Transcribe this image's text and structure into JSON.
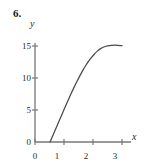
{
  "figure": {
    "problem_number": "6."
  },
  "chart_data": {
    "type": "line",
    "title": "",
    "xlabel": "x",
    "ylabel": "y",
    "xlim": [
      0,
      3.3
    ],
    "ylim": [
      0,
      16.5
    ],
    "xticks": [
      0,
      1,
      2,
      3
    ],
    "xtick_labels": [
      "0",
      "1",
      "2",
      "3"
    ],
    "yticks": [
      0,
      5,
      10,
      15
    ],
    "ytick_labels": [
      "0",
      "5",
      "10",
      "15"
    ],
    "grid": false,
    "legend": null,
    "annotations": [],
    "series": [
      {
        "name": "curve",
        "color": "#4a4a4a",
        "x": [
          0.52,
          0.6,
          0.7,
          0.8,
          0.9,
          1.0,
          1.1,
          1.2,
          1.3,
          1.4,
          1.5,
          1.6,
          1.7,
          1.8,
          1.9,
          2.0,
          2.1,
          2.2,
          2.3,
          2.4,
          2.5,
          2.6,
          2.7,
          2.8,
          2.9,
          3.0
        ],
        "y": [
          0.0,
          0.85,
          1.9,
          2.95,
          4.0,
          5.05,
          6.1,
          7.1,
          8.1,
          9.05,
          9.95,
          10.8,
          11.6,
          12.3,
          12.95,
          13.5,
          14.0,
          14.4,
          14.7,
          14.9,
          15.02,
          15.1,
          15.12,
          15.12,
          15.1,
          15.05
        ]
      }
    ]
  }
}
